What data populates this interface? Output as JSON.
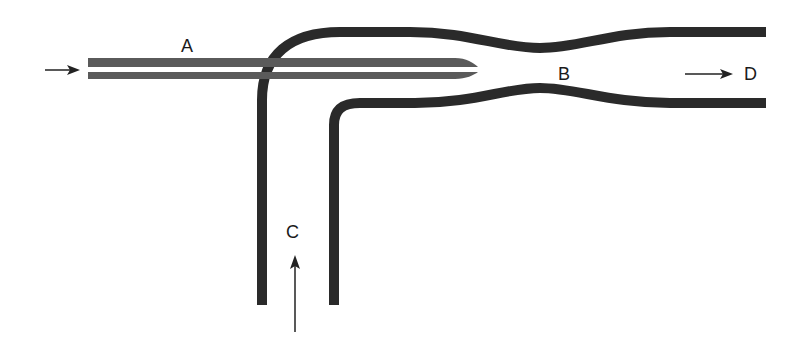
{
  "diagram": {
    "type": "flow-schematic",
    "labels": {
      "a": "A",
      "b": "B",
      "c": "C",
      "d": "D"
    },
    "flows": [
      {
        "from": "inlet-left",
        "via": "A",
        "direction": "right"
      },
      {
        "from": "inlet-bottom",
        "via": "C",
        "direction": "up"
      },
      {
        "from": "B",
        "to": "D",
        "direction": "right"
      }
    ],
    "colors": {
      "tube": "#2a2a2a",
      "needle": "#5a5a5a",
      "arrow": "#222222",
      "background": "#ffffff"
    }
  }
}
